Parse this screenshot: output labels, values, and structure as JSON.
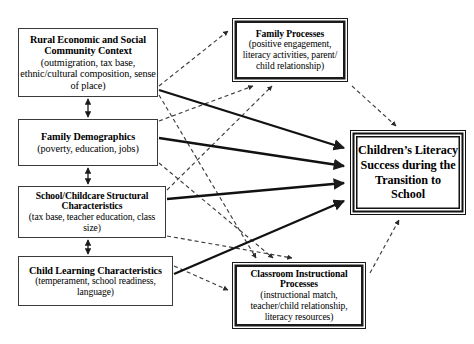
{
  "diagram": {
    "background_color": "#ffffff",
    "line_color": "#1a1a1a",
    "dashed_line_color": "#555555"
  },
  "nodes": {
    "rural_context": {
      "id": "rural-economic-social-community-context",
      "title": "Rural Economic and Social Community Context",
      "detail": "(outmigration, tax base, ethnic/cultural composition, sense of place)",
      "style": "plain",
      "x": 18,
      "y": 28,
      "w": 140,
      "h": 69
    },
    "family_demographics": {
      "id": "family-demographics",
      "title": "Family Demographics",
      "detail": "(poverty, education, jobs)",
      "style": "plain",
      "x": 18,
      "y": 119,
      "w": 140,
      "h": 47
    },
    "school_structural": {
      "id": "school-childcare-structural-characteristics",
      "title": "School/Childcare Structural Characteristics",
      "detail": "(tax base, teacher education, class size)",
      "style": "plain",
      "x": 18,
      "y": 186,
      "w": 148,
      "h": 52
    },
    "child_learning": {
      "id": "child-learning-characteristics",
      "title": "Child Learning Characteristics",
      "detail": "(temperament, school readiness, language)",
      "style": "plain",
      "x": 18,
      "y": 256,
      "w": 155,
      "h": 50
    },
    "family_processes": {
      "id": "family-processes",
      "title": "Family Processes",
      "detail": "(positive engagement, literacy activities, parent/ child relationship)",
      "style": "emphasis",
      "x": 232,
      "y": 18,
      "w": 116,
      "h": 64
    },
    "classroom_processes": {
      "id": "classroom-instructional-processes",
      "title": "Classroom Instructional Processes",
      "detail": "(instructional match, teacher/child relationship, literacy resources)",
      "style": "emphasis",
      "x": 232,
      "y": 262,
      "w": 134,
      "h": 67
    },
    "outcome": {
      "id": "childrens-literacy-success",
      "title": "Children’s Literacy Success during the Transition to School",
      "detail": "",
      "style": "outcome",
      "x": 350,
      "y": 130,
      "w": 116,
      "h": 85
    }
  },
  "connections": [
    {
      "name": "rural-context-to-family-demographics",
      "style": "solid",
      "arrows": "both",
      "from": "rural_context",
      "to": "family_demographics"
    },
    {
      "name": "family-demographics-to-school-structural",
      "style": "solid",
      "arrows": "both",
      "from": "family_demographics",
      "to": "school_structural"
    },
    {
      "name": "school-structural-to-child-learning",
      "style": "solid",
      "arrows": "both",
      "from": "school_structural",
      "to": "child_learning"
    },
    {
      "name": "rural-context-to-family-processes",
      "style": "dashed",
      "arrows": "end",
      "from": "rural_context",
      "to": "family_processes"
    },
    {
      "name": "rural-context-to-classroom-processes",
      "style": "dashed",
      "arrows": "end",
      "from": "rural_context",
      "to": "classroom_processes"
    },
    {
      "name": "family-demographics-to-family-processes",
      "style": "dashed",
      "arrows": "end",
      "from": "family_demographics",
      "to": "family_processes"
    },
    {
      "name": "family-demographics-to-classroom-processes",
      "style": "dashed",
      "arrows": "end",
      "from": "family_demographics",
      "to": "classroom_processes"
    },
    {
      "name": "school-structural-to-family-processes",
      "style": "dashed",
      "arrows": "end",
      "from": "school_structural",
      "to": "family_processes"
    },
    {
      "name": "school-structural-to-classroom-processes",
      "style": "dashed",
      "arrows": "end",
      "from": "school_structural",
      "to": "classroom_processes"
    },
    {
      "name": "child-learning-to-classroom-processes",
      "style": "dashed",
      "arrows": "end",
      "from": "child_learning",
      "to": "classroom_processes"
    },
    {
      "name": "rural-context-to-outcome",
      "style": "solid",
      "arrows": "end",
      "from": "rural_context",
      "to": "outcome"
    },
    {
      "name": "family-demographics-to-outcome",
      "style": "solid",
      "arrows": "end",
      "from": "family_demographics",
      "to": "outcome"
    },
    {
      "name": "school-structural-to-outcome",
      "style": "solid",
      "arrows": "end",
      "from": "school_structural",
      "to": "outcome"
    },
    {
      "name": "child-learning-to-outcome",
      "style": "solid",
      "arrows": "end",
      "from": "child_learning",
      "to": "outcome"
    },
    {
      "name": "family-processes-to-outcome",
      "style": "dashed",
      "arrows": "end",
      "from": "family_processes",
      "to": "outcome"
    },
    {
      "name": "classroom-processes-to-outcome",
      "style": "dashed",
      "arrows": "end",
      "from": "classroom_processes",
      "to": "outcome"
    }
  ]
}
